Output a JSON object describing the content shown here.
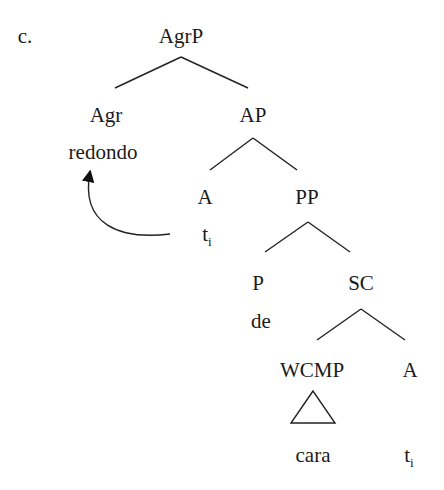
{
  "example_label": "c.",
  "tree": {
    "root": "AgrP",
    "nodes": [
      {
        "id": "agrp",
        "label": "AgrP",
        "x": 181,
        "y": 24
      },
      {
        "id": "agr",
        "label": "Agr",
        "x": 106,
        "y": 103
      },
      {
        "id": "agr-word",
        "label": "redondo",
        "x": 103,
        "y": 140
      },
      {
        "id": "ap",
        "label": "AP",
        "x": 253,
        "y": 103
      },
      {
        "id": "a1",
        "label": "A",
        "x": 205,
        "y": 185
      },
      {
        "id": "a1-trace",
        "label": "t",
        "sub": "i",
        "x": 207,
        "y": 222
      },
      {
        "id": "pp",
        "label": "PP",
        "x": 307,
        "y": 185
      },
      {
        "id": "p",
        "label": "P",
        "x": 258,
        "y": 271
      },
      {
        "id": "p-word",
        "label": "de",
        "x": 261,
        "y": 309
      },
      {
        "id": "sc",
        "label": "SC",
        "x": 361,
        "y": 271
      },
      {
        "id": "wcmp",
        "label": "WCMP",
        "x": 312,
        "y": 358
      },
      {
        "id": "a2",
        "label": "A",
        "x": 410,
        "y": 358
      },
      {
        "id": "wcmp-word",
        "label": "cara",
        "x": 313,
        "y": 443
      },
      {
        "id": "a2-trace",
        "label": "t",
        "sub": "i",
        "x": 409,
        "y": 443
      }
    ],
    "edges": [
      [
        181,
        57,
        115,
        88
      ],
      [
        181,
        57,
        248,
        88
      ],
      [
        253,
        138,
        210,
        170
      ],
      [
        253,
        138,
        297,
        170
      ],
      [
        308,
        222,
        265,
        252
      ],
      [
        308,
        222,
        350,
        252
      ],
      [
        361,
        309,
        317,
        340
      ],
      [
        361,
        309,
        405,
        340
      ]
    ],
    "triangle": {
      "apex": [
        313,
        391
      ],
      "left": [
        291,
        423
      ],
      "right": [
        335,
        423
      ]
    },
    "movement_arrow": {
      "from": "a1-trace",
      "to": "agr-word",
      "path": "M170,234 C120,240 80,225 90,172"
    }
  }
}
